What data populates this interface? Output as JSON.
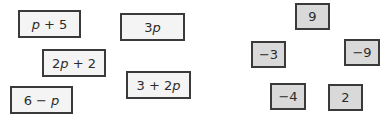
{
  "expression_cards": [
    {
      "label_parts": [
        {
          "t": "p",
          "i": true
        },
        {
          "t": " + 5",
          "i": false
        }
      ],
      "x": 18,
      "y": 10,
      "w": 63,
      "h": 28
    },
    {
      "label_parts": [
        {
          "t": "3",
          "i": false
        },
        {
          "t": "p",
          "i": true
        }
      ],
      "x": 120,
      "y": 13,
      "w": 65,
      "h": 28
    },
    {
      "label_parts": [
        {
          "t": "2",
          "i": false
        },
        {
          "t": "p",
          "i": true
        },
        {
          "t": " + 2",
          "i": false
        }
      ],
      "x": 42,
      "y": 49,
      "w": 64,
      "h": 28
    },
    {
      "label_parts": [
        {
          "t": "3 + 2",
          "i": false
        },
        {
          "t": "p",
          "i": true
        }
      ],
      "x": 126,
      "y": 71,
      "w": 65,
      "h": 28
    },
    {
      "label_parts": [
        {
          "t": "6 − ",
          "i": false
        },
        {
          "t": "p",
          "i": true
        }
      ],
      "x": 10,
      "y": 86,
      "w": 63,
      "h": 28
    }
  ],
  "number_cards": [
    {
      "label": "9",
      "x": 295,
      "y": 3,
      "w": 35,
      "h": 27
    },
    {
      "label": "−3",
      "x": 251,
      "y": 41,
      "w": 35,
      "h": 27
    },
    {
      "label": "−9",
      "x": 344,
      "y": 39,
      "w": 36,
      "h": 27
    },
    {
      "label": "−4",
      "x": 270,
      "y": 83,
      "w": 36,
      "h": 27
    },
    {
      "label": "2",
      "x": 328,
      "y": 84,
      "w": 35,
      "h": 27
    }
  ],
  "colors": {
    "border": "#3a3a3a",
    "expression_fill": "#f4f4f4",
    "number_fill": "#d9d9d9",
    "text": "#2a2a2a"
  }
}
